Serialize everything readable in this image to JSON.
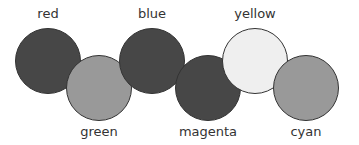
{
  "circles": [
    {
      "label": "red",
      "fill": "#474747",
      "cx": 48,
      "cy": 61,
      "label_pos": "top"
    },
    {
      "label": "green",
      "fill": "#999999",
      "cx": 99,
      "cy": 88,
      "label_pos": "bottom"
    },
    {
      "label": "blue",
      "fill": "#474747",
      "cx": 152,
      "cy": 61,
      "label_pos": "top"
    },
    {
      "label": "magenta",
      "fill": "#474747",
      "cx": 208,
      "cy": 88,
      "label_pos": "bottom"
    },
    {
      "label": "yellow",
      "fill": "#efefef",
      "cx": 255,
      "cy": 61,
      "label_pos": "top"
    },
    {
      "label": "cyan",
      "fill": "#999999",
      "cx": 306,
      "cy": 88,
      "label_pos": "bottom"
    }
  ]
}
